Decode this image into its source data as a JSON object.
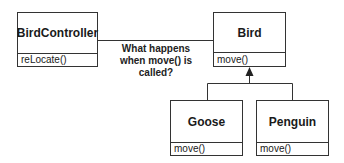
{
  "diagram": {
    "classes": [
      {
        "id": "birdcontroller",
        "name": "BirdController",
        "method": "reLocate()"
      },
      {
        "id": "bird",
        "name": "Bird",
        "method": "move()"
      },
      {
        "id": "goose",
        "name": "Goose",
        "method": "move()"
      },
      {
        "id": "penguin",
        "name": "Penguin",
        "method": "move()"
      }
    ],
    "association_note": {
      "lines": [
        "What happens",
        "when move() is",
        "called?"
      ]
    },
    "relationships": [
      {
        "type": "association",
        "from": "BirdController",
        "to": "Bird"
      },
      {
        "type": "inheritance",
        "from": "Goose",
        "to": "Bird"
      },
      {
        "type": "inheritance",
        "from": "Penguin",
        "to": "Bird"
      }
    ],
    "colors": {
      "line": "#333333",
      "text": "#1a1a1a",
      "background": "#ffffff"
    }
  }
}
